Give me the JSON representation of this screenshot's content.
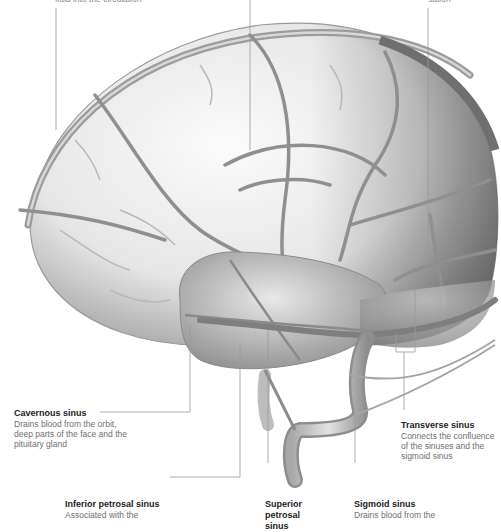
{
  "diagram": {
    "top_labels": [
      {
        "id": "top-left",
        "text": "fluid into the circulation",
        "partially_visible": true
      },
      {
        "id": "top-right",
        "text": "sation",
        "partially_visible": true
      }
    ],
    "labels": [
      {
        "id": "cavernous-sinus",
        "title": "Cavernous sinus",
        "description": "Drains blood from the orbit, deep parts of the face and the pituitary gland"
      },
      {
        "id": "transverse-sinus",
        "title": "Transverse sinus",
        "description": "Connects the confluence of the sinuses and the sigmoid sinus"
      },
      {
        "id": "inferior-petrosal-sinus",
        "title": "Inferior petrosal sinus",
        "description": "Associated with the"
      },
      {
        "id": "superior-petrosal-sinus",
        "title": "Superior petrosal sinus",
        "description": ""
      },
      {
        "id": "sigmoid-sinus",
        "title": "Sigmoid sinus",
        "description": "Drains blood from the"
      }
    ],
    "colors": {
      "background": "#ffffff",
      "brain_light": "#f1f1f1",
      "brain_shade": "#9a9a9a",
      "vein": "#8c8c8c",
      "leader_line": "#9a9a9a",
      "title_text": "#222222",
      "desc_text": "#6f6f6f"
    }
  }
}
